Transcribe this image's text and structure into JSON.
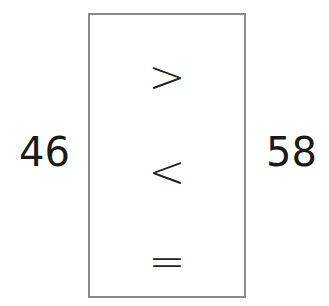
{
  "left_number": "46",
  "right_number": "58",
  "choices": [
    ">",
    "<",
    "="
  ]
}
